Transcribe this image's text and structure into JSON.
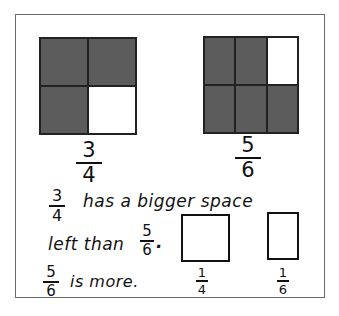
{
  "figure": {
    "left_model": {
      "rows": 2,
      "cols": 2,
      "cells": [
        "shaded",
        "shaded",
        "shaded",
        "empty"
      ],
      "label": {
        "numerator": "3",
        "denominator": "4"
      }
    },
    "right_model": {
      "rows": 2,
      "cols": 3,
      "cells": [
        "shaded",
        "shaded",
        "empty",
        "shaded",
        "shaded",
        "shaded"
      ],
      "label": {
        "numerator": "5",
        "denominator": "6"
      }
    }
  },
  "explanation": {
    "line1_fraction": {
      "numerator": "3",
      "denominator": "4"
    },
    "line1_text": "has a bigger space",
    "line2_text": "left than",
    "line2_fraction": {
      "numerator": "5",
      "denominator": "6"
    },
    "line2_end": ".",
    "line3_fraction": {
      "numerator": "5",
      "denominator": "6"
    },
    "line3_text": "is more."
  },
  "remainder_boxes": [
    {
      "label": {
        "numerator": "1",
        "denominator": "4"
      }
    },
    {
      "label": {
        "numerator": "1",
        "denominator": "6"
      }
    }
  ],
  "colors": {
    "shade": "#8c8c8c",
    "ink": "#111111",
    "frame": "#6a6a6a"
  }
}
